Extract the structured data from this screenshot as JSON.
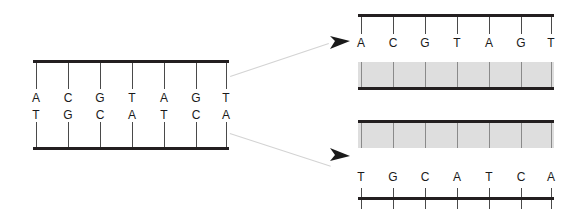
{
  "figure": {
    "title": "",
    "background_color": "#ffffff",
    "strand_color": "#231f20",
    "tick_color": "#4a4a4a",
    "band_color": "#dedede",
    "band_tick_color": "#8a8a8a",
    "leader_color": "#d3d3d3",
    "arrow_color": "#1a1a1a"
  },
  "duplex": {
    "name": "double-stranded-dna",
    "top_strand": {
      "label": "top-strand",
      "bases": [
        "A",
        "C",
        "G",
        "T",
        "A",
        "G",
        "T"
      ]
    },
    "bottom_strand": {
      "label": "bottom-strand",
      "bases": [
        "T",
        "G",
        "C",
        "A",
        "T",
        "C",
        "A"
      ]
    }
  },
  "separated": {
    "upper": {
      "name": "separated-top-strand",
      "bases": [
        "A",
        "C",
        "G",
        "T",
        "A",
        "G",
        "T"
      ],
      "has_template_band": true,
      "band_position": "below"
    },
    "lower": {
      "name": "separated-bottom-strand",
      "bases": [
        "T",
        "G",
        "C",
        "A",
        "T",
        "C",
        "A"
      ],
      "has_template_band": true,
      "band_position": "above"
    }
  },
  "arrows": [
    {
      "name": "arrow-to-top-strand",
      "direction": "right"
    },
    {
      "name": "arrow-to-bottom-strand",
      "direction": "right"
    }
  ]
}
